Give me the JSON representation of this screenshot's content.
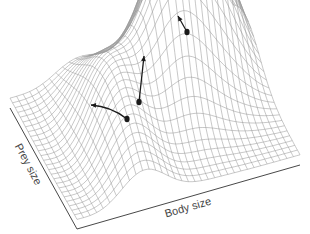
{
  "figure": {
    "type": "fitness-landscape-3d-wireframe",
    "x_axis_label": "Body size",
    "y_axis_label": "Prey size",
    "colors": {
      "mesh": "#9a9a9a",
      "mesh_dense": "#7a7a7a",
      "axis": "#333333",
      "arrow": "#1a1a1a",
      "label": "#444444",
      "background": "#ffffff"
    },
    "base_plane": {
      "back_left": [
        10,
        108
      ],
      "front_left": [
        77,
        229
      ],
      "front_right": [
        300,
        165
      ]
    },
    "peaks": [
      {
        "name": "tall-peak",
        "u": 0.78,
        "v": 0.18,
        "height": 1.0,
        "spread_u": 0.13,
        "spread_v": 0.22
      },
      {
        "name": "middle-peak",
        "u": 0.58,
        "v": 0.4,
        "height": 0.72,
        "spread_u": 0.12,
        "spread_v": 0.2
      },
      {
        "name": "low-ridge",
        "u": 0.3,
        "v": 0.55,
        "height": 0.4,
        "spread_u": 0.1,
        "spread_v": 0.35
      }
    ],
    "arrows": [
      {
        "name": "arrow-to-tall-peak",
        "from": [
          187,
          32
        ],
        "to": [
          178,
          16
        ],
        "curve": 0
      },
      {
        "name": "arrow-to-middle-peak",
        "from": [
          139,
          102
        ],
        "to": [
          144,
          56
        ],
        "curve": 0
      },
      {
        "name": "arrow-along-ridge",
        "from": [
          127,
          119
        ],
        "to": [
          91,
          105
        ],
        "curve": 6
      }
    ],
    "grid": {
      "u_lines": 34,
      "v_lines": 26
    }
  }
}
